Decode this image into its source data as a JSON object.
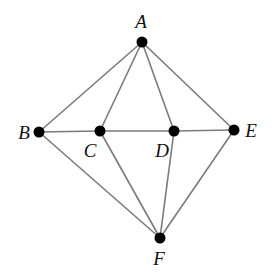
{
  "diagram": {
    "type": "graph",
    "colors": {
      "edge": "#7a7a7a",
      "node": "#000000",
      "label": "#111111"
    },
    "nodes": [
      {
        "id": "A",
        "label": "A",
        "x": 142,
        "y": 42,
        "lx": 141,
        "ly": 28
      },
      {
        "id": "B",
        "label": "B",
        "x": 39,
        "y": 132,
        "lx": 24,
        "ly": 139
      },
      {
        "id": "C",
        "label": "C",
        "x": 100,
        "y": 131,
        "lx": 90,
        "ly": 157
      },
      {
        "id": "D",
        "label": "D",
        "x": 174,
        "y": 131,
        "lx": 162,
        "ly": 157
      },
      {
        "id": "E",
        "label": "E",
        "x": 234,
        "y": 130,
        "lx": 251,
        "ly": 137
      },
      {
        "id": "F",
        "label": "F",
        "x": 160,
        "y": 238,
        "lx": 159,
        "ly": 265
      }
    ],
    "edges": [
      [
        "A",
        "B"
      ],
      [
        "A",
        "C"
      ],
      [
        "A",
        "D"
      ],
      [
        "A",
        "E"
      ],
      [
        "B",
        "C"
      ],
      [
        "C",
        "D"
      ],
      [
        "D",
        "E"
      ],
      [
        "B",
        "F"
      ],
      [
        "C",
        "F"
      ],
      [
        "D",
        "F"
      ],
      [
        "E",
        "F"
      ]
    ]
  }
}
